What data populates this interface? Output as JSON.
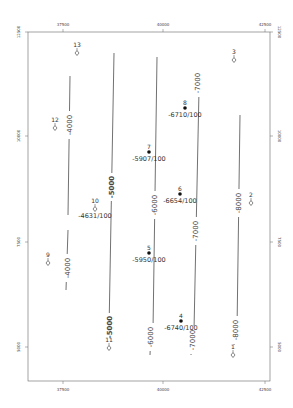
{
  "map": {
    "type": "structure-contour-map",
    "frame": {
      "left": 28,
      "top": 32,
      "right": 270,
      "bottom": 381
    },
    "x_axis": {
      "ticks": [
        {
          "label": "37500",
          "x": 63
        },
        {
          "label": "40000",
          "x": 163
        },
        {
          "label": "42500",
          "x": 265
        }
      ]
    },
    "y_axis": {
      "ticks": [
        {
          "label": "12500",
          "y": 32
        },
        {
          "label": "10000",
          "y": 136
        },
        {
          "label": "7500",
          "y": 242
        },
        {
          "label": "5000",
          "y": 347
        }
      ]
    },
    "contours": [
      {
        "label": "-4000",
        "points": [
          [
            70,
            76
          ],
          [
            68,
            215
          ]
        ],
        "label_pos": [
          69,
          125
        ]
      },
      {
        "label": "-4000",
        "points": [
          [
            68,
            230
          ],
          [
            66,
            290
          ]
        ],
        "label_pos": [
          67,
          268
        ]
      },
      {
        "label": "-5000",
        "points": [
          [
            114,
            53
          ],
          [
            109,
            330
          ]
        ],
        "label_pos": [
          111,
          187
        ],
        "bold": true
      },
      {
        "label": "-5000",
        "points": [
          [
            109,
            330
          ],
          [
            108,
            335
          ]
        ],
        "label_pos": [
          109,
          327
        ],
        "bold": true
      },
      {
        "label": "-6000",
        "points": [
          [
            157,
            57
          ],
          [
            153,
            330
          ]
        ],
        "label_pos": [
          154,
          205
        ]
      },
      {
        "label": "-6000",
        "points": [
          [
            151,
            330
          ],
          [
            150,
            355
          ]
        ],
        "label_pos": [
          150,
          337
        ]
      },
      {
        "label": "-7000",
        "points": [
          [
            199,
            90
          ],
          [
            194,
            330
          ]
        ],
        "label_pos": [
          197,
          83
        ]
      },
      {
        "label": "-7000",
        "points": [
          [
            194,
            230
          ],
          [
            194,
            230
          ]
        ],
        "label_pos": [
          195,
          231
        ]
      },
      {
        "label": "-7000",
        "points": [
          [
            192,
            330
          ],
          [
            191,
            355
          ]
        ],
        "label_pos": [
          192,
          340
        ]
      },
      {
        "label": "-8000",
        "points": [
          [
            240,
            115
          ],
          [
            237,
            330
          ]
        ],
        "label_pos": [
          238,
          203
        ]
      },
      {
        "label": "-8000",
        "points": [
          [
            235,
            330
          ],
          [
            234,
            345
          ]
        ],
        "label_pos": [
          235,
          330
        ]
      }
    ],
    "wells": [
      {
        "id": "13",
        "x": 77,
        "y": 53,
        "symbol": "diamond",
        "value": ""
      },
      {
        "id": "12",
        "x": 55,
        "y": 128,
        "symbol": "diamond",
        "value": ""
      },
      {
        "id": "3",
        "x": 234,
        "y": 60,
        "symbol": "diamond",
        "value": ""
      },
      {
        "id": "8",
        "x": 185,
        "y": 108,
        "symbol": "dot",
        "value": "-6710/100"
      },
      {
        "id": "7",
        "x": 149,
        "y": 152,
        "symbol": "dot",
        "value": "-5907/100"
      },
      {
        "id": "10",
        "x": 95,
        "y": 209,
        "symbol": "diamond",
        "value": "-4631/100"
      },
      {
        "id": "6",
        "x": 180,
        "y": 194,
        "symbol": "dot",
        "value": "-6654/100"
      },
      {
        "id": "2",
        "x": 251,
        "y": 203,
        "symbol": "diamond",
        "value": ""
      },
      {
        "id": "5",
        "x": 149,
        "y": 253,
        "symbol": "dot",
        "value": "-5950/100"
      },
      {
        "id": "9",
        "x": 48,
        "y": 263,
        "symbol": "diamond",
        "value": ""
      },
      {
        "id": "4",
        "x": 181,
        "y": 321,
        "symbol": "dot",
        "value": "-6740/100"
      },
      {
        "id": "11",
        "x": 109,
        "y": 348,
        "symbol": "diamond",
        "value": ""
      },
      {
        "id": "1",
        "x": 233,
        "y": 355,
        "symbol": "diamond",
        "value": ""
      }
    ]
  }
}
